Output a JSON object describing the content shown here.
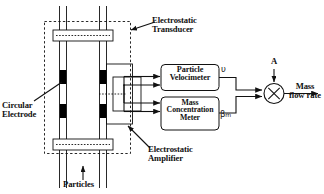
{
  "diagram": {
    "type": "block-schematic",
    "labels": {
      "electrostatic_transducer": "Electrostatic\nTransducer",
      "electrostatic_transducer_line1": "Electrostatic",
      "electrostatic_transducer_line2": "Transducer",
      "circular_electrode_line1": "Circular",
      "circular_electrode_line2": "Electrode",
      "electrostatic_amplifier_line1": "Electrostatic",
      "electrostatic_amplifier_line2": "Amplifier",
      "particles": "Particles",
      "mass_flow_rate_line1": "Mass",
      "mass_flow_rate_line2": "flow rate"
    },
    "blocks": [
      {
        "id": "particle_velocimeter",
        "line1": "Particle",
        "line2": "Velocimeter",
        "output_symbol": "υ"
      },
      {
        "id": "mass_concentration_meter",
        "line1": "Mass",
        "line2": "Concentration",
        "line3": "Meter",
        "output_symbol": "β",
        "output_subscript": "m"
      }
    ],
    "multiplier": {
      "glyph": "×",
      "top_input_label": "A",
      "output_label_line1": "Mass",
      "output_label_line2": "flow rate"
    },
    "colors": {
      "stroke": "#111111",
      "electrode_fill": "#000000",
      "background": "#ffffff",
      "dashed_boundary": "#111111"
    }
  }
}
